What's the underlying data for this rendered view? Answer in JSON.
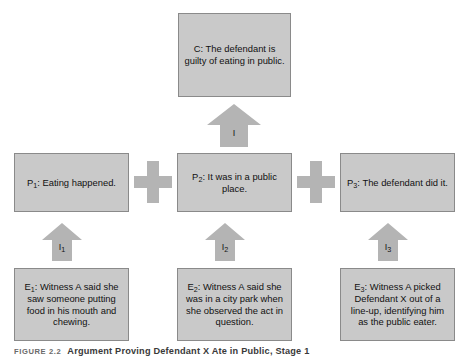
{
  "figure": {
    "label": "FIGURE 2.2",
    "caption": "Argument Proving Defendant X Ate in Public, Stage 1"
  },
  "diagram": {
    "type": "argument-diagram",
    "conclusion": {
      "id": "C",
      "prefix": "C:",
      "text": "The defendant is guilty of eating in public."
    },
    "premises": [
      {
        "id": "P1",
        "prefix": "P",
        "subscript": "1",
        "text": ": Eating happened."
      },
      {
        "id": "P2",
        "prefix": "P",
        "subscript": "2",
        "text": ": It was in a public place."
      },
      {
        "id": "P3",
        "prefix": "P",
        "subscript": "3",
        "text": ": The defendant did it."
      }
    ],
    "evidence": [
      {
        "id": "E1",
        "prefix": "E",
        "subscript": "1",
        "text": ": Witness A said she saw someone putting food in his mouth and chewing."
      },
      {
        "id": "E2",
        "prefix": "E",
        "subscript": "2",
        "text": ": Witness A said she was in a city park when she observed the act in question."
      },
      {
        "id": "E3",
        "prefix": "E",
        "subscript": "3",
        "text": ": Witness A picked Defendant X out of a line-up, identifying him as the public eater."
      }
    ],
    "inferences": [
      {
        "id": "I",
        "label": "I",
        "subscript": "",
        "from": "P1+P2+P3",
        "to": "C"
      },
      {
        "id": "I1",
        "label": "I",
        "subscript": "1",
        "from": "E1",
        "to": "P1"
      },
      {
        "id": "I2",
        "label": "I",
        "subscript": "2",
        "from": "E2",
        "to": "P2"
      },
      {
        "id": "I3",
        "label": "I",
        "subscript": "3",
        "from": "E3",
        "to": "P3"
      }
    ],
    "connectors": [
      {
        "id": "plus-1",
        "symbol": "+",
        "between": [
          "P1",
          "P2"
        ]
      },
      {
        "id": "plus-2",
        "symbol": "+",
        "between": [
          "P2",
          "P3"
        ]
      }
    ],
    "colors": {
      "box_fill": "#c9c9c9",
      "box_border": "#8a8a8a",
      "arrow_fill": "#b4b4b4",
      "text": "#111111",
      "background": "#ffffff"
    }
  }
}
